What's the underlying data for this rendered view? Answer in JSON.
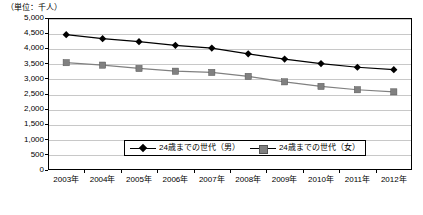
{
  "unit_note": "（単位：千人）",
  "chart_data": {
    "type": "line",
    "title": "",
    "subtitle": "",
    "xlabel": "",
    "ylabel": "（単位：千人）",
    "categories": [
      "2003年",
      "2004年",
      "2005年",
      "2006年",
      "2007年",
      "2008年",
      "2009年",
      "2010年",
      "2011年",
      "2012年"
    ],
    "yticks": [
      "0",
      "500",
      "1,000",
      "1,500",
      "2,000",
      "2,500",
      "3,000",
      "3,500",
      "4,000",
      "4,500",
      "5,000"
    ],
    "ylim": [
      0,
      5000
    ],
    "ytick_step": 500,
    "grid": true,
    "legend_position": "inside-bottom-center",
    "series": [
      {
        "name": "24歳までの世代（男）",
        "marker": "diamond",
        "color": "#000000",
        "values": [
          4450,
          4320,
          4220,
          4100,
          4010,
          3820,
          3650,
          3500,
          3380,
          3300
        ]
      },
      {
        "name": "24歳までの世代（女）",
        "marker": "square",
        "color": "#808080",
        "values": [
          3530,
          3450,
          3340,
          3250,
          3210,
          3080,
          2900,
          2750,
          2640,
          2570
        ]
      }
    ]
  }
}
